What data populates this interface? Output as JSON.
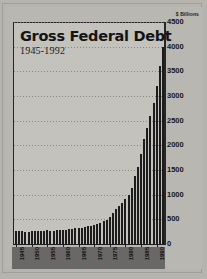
{
  "figure": {
    "title": "Gross Federal Debt",
    "subtitle": "1945-1992",
    "units_label": "$ Billions"
  },
  "chart_data": {
    "type": "bar",
    "title": "Gross Federal Debt",
    "subtitle": "1945-1992",
    "xlabel": "",
    "ylabel": "$ Billions",
    "ylim": [
      0,
      4500
    ],
    "ytick_values": [
      0,
      500,
      1000,
      1500,
      2000,
      2500,
      3000,
      3500,
      4000,
      4500
    ],
    "ytick_labels": [
      "0",
      "500",
      "1000",
      "1500",
      "2000",
      "2500",
      "3000",
      "3500",
      "4000",
      "4500"
    ],
    "grid": true,
    "legend": "none",
    "xtick_labels": [
      "1945",
      "1950",
      "1955",
      "1960",
      "1965",
      "1970",
      "1975",
      "1980",
      "1985",
      "1990"
    ],
    "xtick_years": [
      1945,
      1950,
      1955,
      1960,
      1965,
      1970,
      1975,
      1980,
      1985,
      1990
    ],
    "categories": [
      "1945",
      "1946",
      "1947",
      "1948",
      "1949",
      "1950",
      "1951",
      "1952",
      "1953",
      "1954",
      "1955",
      "1956",
      "1957",
      "1958",
      "1959",
      "1960",
      "1961",
      "1962",
      "1963",
      "1964",
      "1965",
      "1966",
      "1967",
      "1968",
      "1969",
      "1970",
      "1971",
      "1972",
      "1973",
      "1974",
      "1975",
      "1976",
      "1977",
      "1978",
      "1979",
      "1980",
      "1981",
      "1982",
      "1983",
      "1984",
      "1985",
      "1986",
      "1987",
      "1988",
      "1989",
      "1990",
      "1991",
      "1992"
    ],
    "values": [
      260,
      271,
      257,
      252,
      253,
      257,
      255,
      259,
      266,
      271,
      274,
      273,
      271,
      276,
      285,
      287,
      293,
      303,
      311,
      317,
      323,
      329,
      341,
      370,
      367,
      381,
      408,
      436,
      466,
      484,
      541,
      629,
      706,
      777,
      829,
      909,
      994,
      1137,
      1371,
      1564,
      1817,
      2120,
      2346,
      2601,
      2868,
      3206,
      3599,
      4002
    ]
  }
}
